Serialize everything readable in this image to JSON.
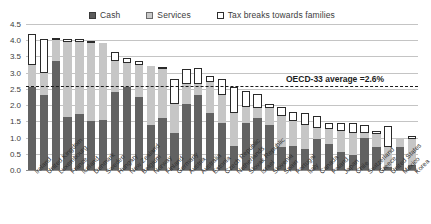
{
  "chart_data": {
    "type": "bar",
    "stacked": true,
    "title": "",
    "subtitle": "",
    "xlabel": "",
    "ylabel": "",
    "ylim": [
      0.0,
      4.5
    ],
    "ytick_labels": [
      "0.0",
      "0.5",
      "1.0",
      "1.5",
      "2.0",
      "2.5",
      "3.0",
      "3.5",
      "4.0",
      "4.5"
    ],
    "ytick_values": [
      0.0,
      0.5,
      1.0,
      1.5,
      2.0,
      2.5,
      3.0,
      3.5,
      4.0,
      4.5
    ],
    "grid": true,
    "legend_position": "top-center",
    "legend": [
      "Cash",
      "Services",
      "Tax breaks towards families"
    ],
    "colors": {
      "cash": "#626262",
      "services": "#c6c6c6",
      "tax": "#ffffff",
      "tax_border": "#2a2a2a",
      "gridline": "#c4c4c4",
      "average_line": "#1a1a1a"
    },
    "annotation": {
      "label": "OECD-33 average =2.6%",
      "value": 2.6
    },
    "categories": [
      "Ireland",
      "United Kingdom",
      "Luxembourg",
      "France",
      "Iceland",
      "Denmark",
      "Sweden",
      "Hungary",
      "New Zealand",
      "Belgium",
      "Norway",
      "Finland",
      "Germany",
      "Austria",
      "Australia",
      "Estonia",
      "Czech Republic",
      "Netherlands",
      "Slovak Republic",
      "Israel",
      "Slovenia",
      "Spain",
      "Portugal",
      "Italy",
      "Canada",
      "Poland",
      "Japan",
      "Chile",
      "Switzerland",
      "Greece",
      "United States",
      "Mexico",
      "Korea"
    ],
    "series": [
      {
        "name": "Cash",
        "values": [
          2.55,
          2.3,
          3.35,
          1.62,
          1.73,
          1.52,
          1.55,
          2.4,
          2.55,
          2.25,
          1.4,
          1.6,
          1.15,
          2.05,
          2.3,
          1.75,
          1.45,
          0.75,
          1.45,
          1.6,
          1.4,
          0.7,
          0.75,
          0.65,
          0.95,
          0.8,
          0.55,
          0.45,
          1.0,
          0.7,
          0.1,
          0.7,
          0.15
        ]
      },
      {
        "name": "Services",
        "values": [
          0.7,
          0.7,
          0.65,
          2.33,
          2.22,
          2.38,
          2.35,
          0.95,
          0.75,
          1.0,
          1.8,
          1.5,
          0.9,
          0.6,
          0.35,
          0.95,
          0.85,
          1.0,
          0.5,
          0.3,
          0.5,
          0.95,
          0.75,
          0.75,
          0.35,
          0.45,
          0.65,
          0.7,
          0.15,
          0.4,
          0.6,
          0.25,
          0.8
        ]
      },
      {
        "name": "Tax breaks towards families",
        "values": [
          0.95,
          1.05,
          0.05,
          0.05,
          0.05,
          0.05,
          0.0,
          0.3,
          0.15,
          0.1,
          0.0,
          0.05,
          0.75,
          0.45,
          0.5,
          0.2,
          0.5,
          0.8,
          0.5,
          0.45,
          0.15,
          0.3,
          0.3,
          0.35,
          0.35,
          0.2,
          0.25,
          0.3,
          0.25,
          0.1,
          0.65,
          0.0,
          0.1
        ]
      }
    ],
    "totals": [
      4.2,
      4.05,
      4.05,
      4.0,
      4.0,
      3.95,
      3.9,
      3.65,
      3.45,
      3.35,
      3.2,
      3.15,
      2.8,
      3.1,
      3.15,
      2.9,
      2.8,
      2.55,
      2.45,
      2.35,
      2.05,
      1.95,
      1.8,
      1.75,
      1.65,
      1.45,
      1.45,
      1.45,
      1.4,
      1.2,
      1.35,
      0.95,
      1.05
    ]
  }
}
